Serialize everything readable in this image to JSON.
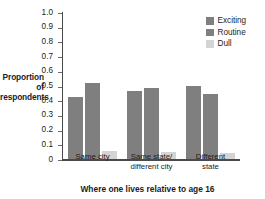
{
  "chart_data": {
    "type": "bar",
    "title": "",
    "xlabel": "Where one lives relative to age 16",
    "ylabel": "Proportion of\nrespondents",
    "categories": [
      "Same city",
      "Same state/\ndifferent city",
      "Different\nstate"
    ],
    "series": [
      {
        "name": "Exciting",
        "color": "#7f7f7f",
        "values": [
          0.42,
          0.46,
          0.5
        ]
      },
      {
        "name": "Routine",
        "color": "#7f7f7f",
        "values": [
          0.52,
          0.48,
          0.44
        ]
      },
      {
        "name": "Dull",
        "color": "#d4d4d4",
        "values": [
          0.055,
          0.045,
          0.04
        ]
      }
    ],
    "ylim": [
      0,
      1.0
    ],
    "yticks": [
      "1.0",
      "0.9",
      "0.8",
      "0.7",
      "0.6",
      "0.5",
      "0.4",
      "0.3",
      "0.2",
      "0.1",
      "0"
    ],
    "ytick_values": [
      1.0,
      0.9,
      0.8,
      0.7,
      0.6,
      0.5,
      0.4,
      0.3,
      0.2,
      0.1,
      0
    ],
    "grid": false,
    "legend_position": "top-right",
    "legend_entries": [
      "Exciting",
      "Routine",
      "Dull"
    ]
  },
  "axis": {
    "y_title": "Proportion of respondents",
    "y_title_line1": "Proportion of",
    "y_title_line2": "respondents",
    "x_title": "Where one lives relative to age 16"
  },
  "colors": {
    "bar_dark": "#7f7f7f",
    "bar_light": "#d4d4d4",
    "axis": "#4a4a4a",
    "text": "#1c1c1c",
    "background": "#ffffff"
  }
}
